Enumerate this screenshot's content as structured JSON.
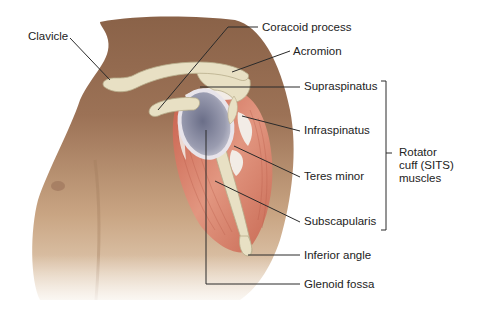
{
  "diagram": {
    "labels": [
      {
        "id": "clavicle",
        "text": "Clavicle",
        "x": 28,
        "y": 30
      },
      {
        "id": "coracoid-process",
        "text": "Coracoid process",
        "x": 262,
        "y": 21
      },
      {
        "id": "acromion",
        "text": "Acromion",
        "x": 293,
        "y": 45
      },
      {
        "id": "supraspinatus",
        "text": "Supraspinatus",
        "x": 304,
        "y": 80
      },
      {
        "id": "infraspinatus",
        "text": "Infraspinatus",
        "x": 304,
        "y": 124
      },
      {
        "id": "teres-minor",
        "text": "Teres minor",
        "x": 304,
        "y": 170
      },
      {
        "id": "subscapularis",
        "text": "Subscapularis",
        "x": 304,
        "y": 215
      },
      {
        "id": "inferior-angle",
        "text": "Inferior angle",
        "x": 304,
        "y": 249
      },
      {
        "id": "glenoid-fossa",
        "text": "Glenoid fossa",
        "x": 304,
        "y": 278
      }
    ],
    "group_label": {
      "id": "rotator-cuff",
      "text": "Rotator\ncuff (SITS)\nmuscles",
      "x": 399,
      "y": 146
    },
    "bracket": {
      "x": 386,
      "top": 81,
      "bottom": 230,
      "mid": 153
    },
    "colors": {
      "skin_dark": "#8a6248",
      "skin_light": "#d6b898",
      "bone": "#e8e0c4",
      "bone_shadow": "#b8ad8c",
      "muscle": "#d8826c",
      "muscle_dark": "#b85a48",
      "tendon": "#f2ece6",
      "glenoid": "#9a9cb0",
      "leader_line": "#2a2a2a",
      "text": "#222222"
    }
  }
}
